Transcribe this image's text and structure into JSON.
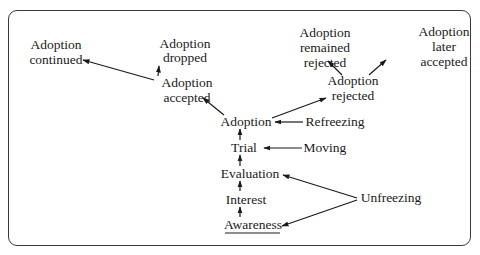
{
  "diagram": {
    "type": "flow-diagram",
    "nodes": {
      "adoption_continued": {
        "lines": [
          "Adoption",
          "continued"
        ]
      },
      "adoption_dropped": {
        "lines": [
          "Adoption",
          "dropped"
        ]
      },
      "adoption_accepted": {
        "lines": [
          "Adoption",
          "accepted"
        ]
      },
      "adoption": {
        "label": "Adoption"
      },
      "trial": {
        "label": "Trial"
      },
      "evaluation": {
        "label": "Evaluation"
      },
      "interest": {
        "label": "Interest"
      },
      "awareness": {
        "label": "Awareness"
      },
      "refreezing": {
        "label": "Refreezing"
      },
      "moving": {
        "label": "Moving"
      },
      "unfreezing": {
        "label": "Unfreezing"
      },
      "adoption_rejected": {
        "lines": [
          "Adoption",
          "rejected"
        ]
      },
      "adoption_remained_rejected": {
        "lines": [
          "Adoption",
          "remained",
          "rejected"
        ]
      },
      "adoption_later_accepted": {
        "lines": [
          "Adoption",
          "later",
          "accepted"
        ]
      }
    },
    "edges": [
      {
        "from": "awareness",
        "to": "interest"
      },
      {
        "from": "interest",
        "to": "evaluation"
      },
      {
        "from": "evaluation",
        "to": "trial"
      },
      {
        "from": "trial",
        "to": "adoption"
      },
      {
        "from": "unfreezing",
        "to": "evaluation"
      },
      {
        "from": "unfreezing",
        "to": "awareness"
      },
      {
        "from": "moving",
        "to": "trial"
      },
      {
        "from": "refreezing",
        "to": "adoption"
      },
      {
        "from": "adoption",
        "to": "adoption_accepted"
      },
      {
        "from": "adoption",
        "to": "adoption_rejected"
      },
      {
        "from": "adoption_accepted",
        "to": "adoption_dropped"
      },
      {
        "from": "adoption_accepted",
        "to": "adoption_continued"
      },
      {
        "from": "adoption_rejected",
        "to": "adoption_remained_rejected"
      },
      {
        "from": "adoption_rejected",
        "to": "adoption_later_accepted"
      }
    ]
  }
}
